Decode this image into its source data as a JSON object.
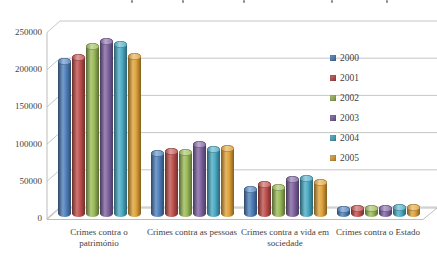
{
  "chart_data": {
    "type": "bar",
    "variant": "3d-cylinder-clustered",
    "title_visible": false,
    "categories": [
      "Crimes contra o património",
      "Crimes contra as pessoas",
      "Crimes contra a vida em sociedade",
      "Crimes contra o Estado"
    ],
    "series": [
      {
        "name": "2000",
        "color": "#4F81BD",
        "values": [
          205000,
          81000,
          33000,
          6500
        ]
      },
      {
        "name": "2001",
        "color": "#C0504D",
        "values": [
          210000,
          84000,
          39000,
          7000
        ]
      },
      {
        "name": "2002",
        "color": "#9BBB59",
        "values": [
          225000,
          82000,
          36000,
          7200
        ]
      },
      {
        "name": "2003",
        "color": "#8064A2",
        "values": [
          232000,
          94000,
          46000,
          7800
        ]
      },
      {
        "name": "2004",
        "color": "#4BACC6",
        "values": [
          228000,
          87000,
          48000,
          8200
        ]
      },
      {
        "name": "2005",
        "color": "#E0A339",
        "values": [
          212000,
          88000,
          42000,
          8500
        ]
      }
    ],
    "y_axis": {
      "min": 0,
      "max": 250000,
      "step": 50000,
      "tick_labels": [
        "0",
        "50000",
        "100000",
        "150000",
        "200000",
        "250000"
      ]
    },
    "legend": {
      "position": "right",
      "entries": [
        "2000",
        "2001",
        "2002",
        "2003",
        "2004",
        "2005"
      ]
    },
    "grid": true,
    "colors": {
      "text": "#3f3f3f",
      "gridline": "#c6c6c6",
      "frame": "#bdbdbd"
    }
  }
}
